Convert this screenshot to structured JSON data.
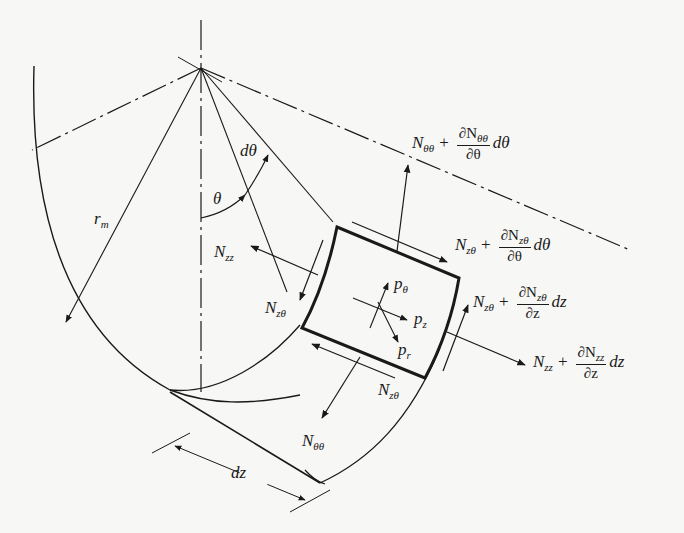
{
  "figure": {
    "colors": {
      "ink": "#1a1a1a",
      "background": "#f7f7f5"
    }
  },
  "labels": {
    "r_m": {
      "base": "r",
      "sub": "m"
    },
    "theta": "θ",
    "d_theta": "dθ",
    "dz": "dz",
    "N_zz_left": {
      "base": "N",
      "sub": "zz"
    },
    "N_ztheta_left": {
      "base": "N",
      "sub": "zθ"
    },
    "N_ztheta_bottom": {
      "base": "N",
      "sub": "zθ"
    },
    "N_thetatheta_bottom": {
      "base": "N",
      "sub": "θθ"
    },
    "p_theta": {
      "base": "p",
      "sub": "θ"
    },
    "p_z": {
      "base": "p",
      "sub": "z"
    },
    "p_r": {
      "base": "p",
      "sub": "r"
    },
    "N_thetatheta_top": {
      "base": "N",
      "sub": "θθ",
      "op": "+",
      "num": "∂N",
      "num_sub": "θθ",
      "den": "∂θ",
      "diff": "dθ"
    },
    "N_ztheta_top": {
      "base": "N",
      "sub": "zθ",
      "op": "+",
      "num": "∂N",
      "num_sub": "zθ",
      "den": "∂θ",
      "diff": "dθ"
    },
    "N_ztheta_right": {
      "base": "N",
      "sub": "zθ",
      "op": "+",
      "num": "∂N",
      "num_sub": "zθ",
      "den": "∂z",
      "diff": "dz"
    },
    "N_zz_right": {
      "base": "N",
      "sub": "zz",
      "op": "+",
      "num": "∂N",
      "num_sub": "zz",
      "den": "∂z",
      "diff": "dz"
    }
  }
}
